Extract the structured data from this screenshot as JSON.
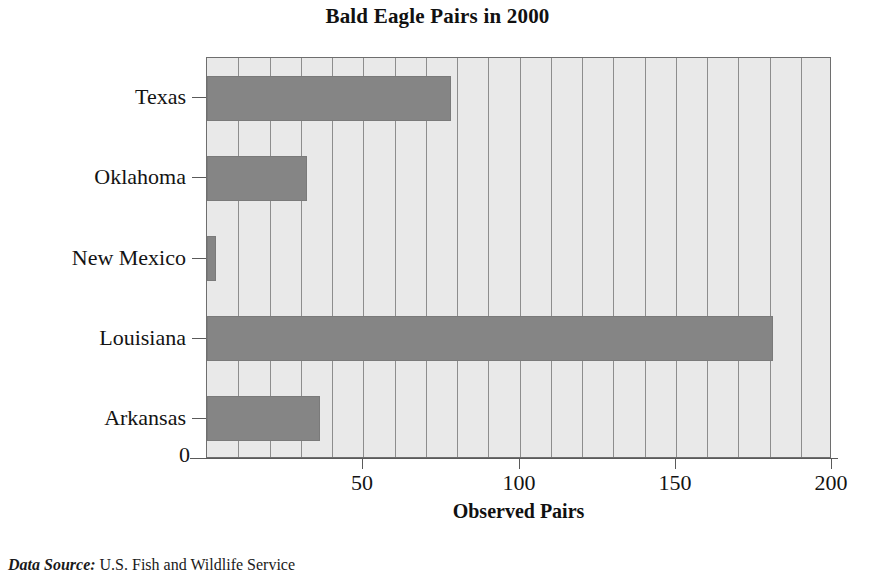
{
  "chart_data": {
    "type": "bar",
    "orientation": "horizontal",
    "title": "Bald Eagle Pairs in 2000",
    "xlabel": "Observed Pairs",
    "ylabel": "",
    "categories": [
      "Texas",
      "Oklahoma",
      "New Mexico",
      "Louisiana",
      "Arkansas"
    ],
    "values": [
      78,
      32,
      3,
      181,
      36
    ],
    "series": [
      {
        "name": "Observed Pairs",
        "values": [
          78,
          32,
          3,
          181,
          36
        ]
      }
    ],
    "xlim": [
      0,
      200
    ],
    "xticks": [
      0,
      50,
      100,
      150,
      200
    ],
    "xtick_labels": [
      "0",
      "50",
      "100",
      "150",
      "200"
    ],
    "minor_gridline_interval": 10,
    "grid": true,
    "legend": false,
    "bar_color": "#858585",
    "plot_background": "#e9e9e9",
    "gridline_color": "#8d8d8d",
    "axis_color": "#5a5a5a"
  },
  "footnote": {
    "label": "Data Source:",
    "text": " U.S. Fish and Wildlife Service"
  }
}
